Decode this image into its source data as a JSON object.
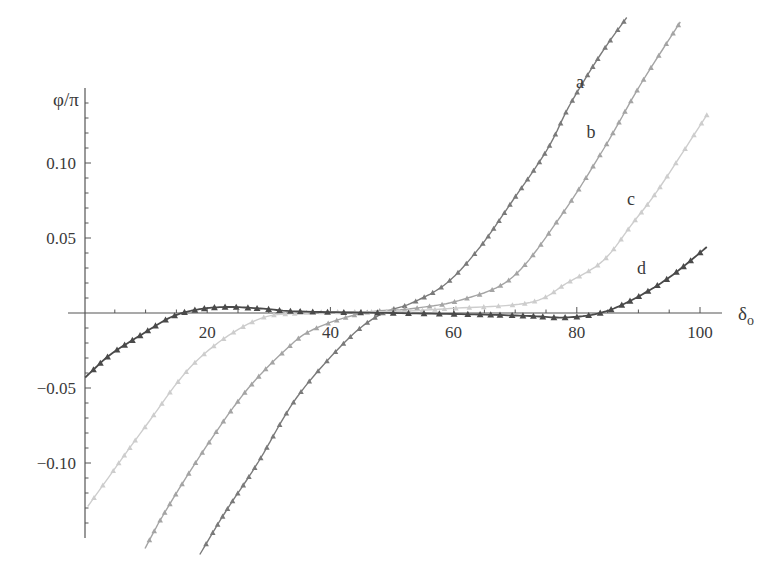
{
  "chart_data": {
    "type": "line",
    "title": "",
    "xlabel": "δ",
    "xlabel_subscript": "o",
    "ylabel": "φ/π",
    "xlim": [
      0,
      103
    ],
    "ylim": [
      -0.15,
      0.15
    ],
    "grid": false,
    "legend": "inline labels near curve ends",
    "x_ticks": [
      20,
      40,
      60,
      80,
      100
    ],
    "x_tick_labels": [
      "20",
      "40",
      "60",
      "80",
      "100"
    ],
    "y_ticks": [
      -0.1,
      -0.05,
      0.05,
      0.1
    ],
    "y_tick_labels": [
      "−0.10",
      "−0.05",
      "0.05",
      "0.10"
    ],
    "series": [
      {
        "name": "a",
        "color": "#7a7a7a",
        "marker": "triangle",
        "x": [
          18.8,
          22.9,
          28.2,
          34.6,
          42.7,
          48.1,
          53.4,
          58.9,
          64.3,
          69.6,
          75.2,
          78.9,
          83.8,
          88.1
        ],
        "y": [
          -0.161,
          -0.133,
          -0.1,
          -0.056,
          -0.018,
          -0.001,
          0.007,
          0.02,
          0.044,
          0.075,
          0.109,
          0.139,
          0.172,
          0.197
        ],
        "label_pos": [
          80.5,
          0.15
        ]
      },
      {
        "name": "b",
        "color": "#a4a4a4",
        "marker": "triangle",
        "x": [
          9.9,
          13.1,
          19.2,
          26.1,
          32.6,
          37.2,
          45.3,
          53.4,
          61.5,
          69.6,
          77.3,
          84.3,
          90.3,
          96.8
        ],
        "y": [
          -0.157,
          -0.133,
          -0.093,
          -0.053,
          -0.025,
          -0.011,
          0.0,
          0.003,
          0.009,
          0.024,
          0.064,
          0.109,
          0.152,
          0.194
        ],
        "label_pos": [
          82.3,
          0.117
        ]
      },
      {
        "name": "c",
        "color": "#cdcdcd",
        "marker": "triangle",
        "x": [
          0.6,
          9.9,
          18.0,
          27.3,
          35.1,
          50.2,
          59.4,
          72.4,
          78.4,
          84.3,
          89.1,
          93.5,
          101.1
        ],
        "y": [
          -0.129,
          -0.076,
          -0.033,
          -0.006,
          0.0,
          0.001,
          0.003,
          0.007,
          0.02,
          0.035,
          0.06,
          0.084,
          0.132
        ],
        "label_pos": [
          88.8,
          0.072
        ]
      },
      {
        "name": "d",
        "color": "#4a4a4a",
        "marker": "triangle",
        "x": [
          0.2,
          4.2,
          9.1,
          14.0,
          18.0,
          22.9,
          28.6,
          35.1,
          50.2,
          64.3,
          72.4,
          78.1,
          83.8,
          89.1,
          95.1,
          101.1
        ],
        "y": [
          -0.043,
          -0.028,
          -0.015,
          -0.003,
          0.002,
          0.004,
          0.003,
          0.001,
          0.0,
          -0.001,
          -0.002,
          -0.003,
          0.0,
          0.009,
          0.024,
          0.044
        ],
        "label_pos": [
          90.5,
          0.026
        ]
      }
    ]
  },
  "layout_px": {
    "origin_x": 84,
    "origin_y": 313,
    "px_per_x": 6.16,
    "px_per_y": 1500,
    "y_axis_top": 88,
    "y_axis_bottom": 538,
    "x_axis_left": 68,
    "x_axis_right": 722
  }
}
